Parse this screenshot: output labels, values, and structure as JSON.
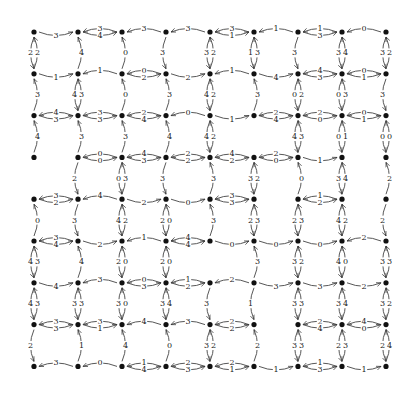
{
  "diagram": {
    "type": "grid-graph",
    "rows": 9,
    "cols": 9,
    "node_color": "#111111",
    "edge_color": "#444444",
    "horizontal_edges": [
      [
        [
          null,
          "3"
        ],
        [
          "3",
          "4"
        ],
        [
          "3",
          null
        ],
        [
          "3",
          null
        ],
        [
          "3",
          "1"
        ],
        [
          "1",
          null
        ],
        [
          "1",
          "3"
        ],
        [
          "0",
          null
        ]
      ],
      [
        [
          null,
          "1"
        ],
        [
          "1",
          null
        ],
        [
          "0",
          "2"
        ],
        [
          null,
          "2"
        ],
        [
          "1",
          null
        ],
        [
          null,
          "4"
        ],
        [
          "4",
          "3"
        ],
        [
          "0",
          "1"
        ]
      ],
      [
        [
          "4",
          "3"
        ],
        [
          "3",
          "3"
        ],
        [
          "2",
          "4"
        ],
        [
          "0",
          null
        ],
        [
          null,
          "1"
        ],
        [
          "2",
          "4"
        ],
        [
          "2",
          "0"
        ],
        [
          "0",
          "1"
        ]
      ],
      [
        [
          null,
          null
        ],
        [
          "0",
          "0"
        ],
        [
          "4",
          "3"
        ],
        [
          "2",
          "2"
        ],
        [
          "4",
          "2"
        ],
        [
          "2",
          "0"
        ],
        [
          null,
          "1"
        ],
        [
          null,
          null
        ]
      ],
      [
        [
          "3",
          "2"
        ],
        [
          "4",
          null
        ],
        [
          null,
          "2"
        ],
        [
          null,
          "0"
        ],
        [
          "3",
          "3"
        ],
        [
          null,
          null
        ],
        [
          "1",
          "2"
        ],
        [
          null,
          null
        ]
      ],
      [
        [
          "3",
          "4"
        ],
        [
          null,
          "2"
        ],
        [
          "1",
          null
        ],
        [
          "4",
          "4"
        ],
        [
          null,
          "0"
        ],
        [
          null,
          "0"
        ],
        [
          null,
          "0"
        ],
        [
          "2",
          null
        ]
      ],
      [
        [
          null,
          "4"
        ],
        [
          "3",
          null
        ],
        [
          "0",
          "3"
        ],
        [
          "1",
          "2"
        ],
        [
          "2",
          null
        ],
        [
          null,
          "3"
        ],
        [
          null,
          "3"
        ],
        [
          null,
          "2"
        ]
      ],
      [
        [
          "3",
          "3"
        ],
        [
          "3",
          "1"
        ],
        [
          "4",
          null
        ],
        [
          "3",
          null
        ],
        [
          "2",
          "2"
        ],
        [
          null,
          null
        ],
        [
          "2",
          "4"
        ],
        [
          "4",
          "0"
        ]
      ],
      [
        [
          "3",
          null
        ],
        [
          "0",
          null
        ],
        [
          "1",
          "4"
        ],
        [
          "2",
          "3"
        ],
        [
          "2",
          "1"
        ],
        [
          null,
          "1"
        ],
        [
          "1",
          "3"
        ],
        [
          null,
          "1"
        ]
      ]
    ],
    "vertical_edges": [
      [
        [
          "2",
          "2"
        ],
        [
          null,
          "3"
        ],
        [
          null,
          "4"
        ],
        [
          null,
          null
        ],
        [
          null,
          "0"
        ],
        [
          "4",
          "3"
        ],
        [
          "4",
          "3"
        ],
        [
          "2",
          null
        ]
      ],
      [
        [
          null,
          "4"
        ],
        [
          "4",
          "3"
        ],
        [
          null,
          "3"
        ],
        [
          "2",
          null
        ],
        [
          "3",
          null
        ],
        [
          null,
          "4"
        ],
        [
          "3",
          "3"
        ],
        [
          null,
          "1"
        ]
      ],
      [
        [
          null,
          "0"
        ],
        [
          null,
          "0"
        ],
        [
          null,
          "3"
        ],
        [
          "0",
          "3"
        ],
        [
          "4",
          "2"
        ],
        [
          "2",
          "0"
        ],
        [
          "3",
          "0"
        ],
        [
          null,
          "4"
        ]
      ],
      [
        [
          "3",
          null
        ],
        [
          null,
          "3"
        ],
        [
          null,
          "4"
        ],
        [
          "3",
          null
        ],
        [
          "2",
          "0"
        ],
        [
          "2",
          "0"
        ],
        [
          "3",
          "4"
        ],
        [
          null,
          "0"
        ]
      ],
      [
        [
          "3",
          "2"
        ],
        [
          "4",
          "2"
        ],
        [
          "4",
          "2"
        ],
        [
          null,
          "3"
        ],
        [
          null,
          "3"
        ],
        [
          null,
          null
        ],
        [
          "3",
          null
        ],
        [
          "3",
          "2"
        ]
      ],
      [
        [
          "1",
          "3"
        ],
        [
          null,
          "3"
        ],
        [
          null,
          null
        ],
        [
          "3",
          "2"
        ],
        [
          "2",
          "3"
        ],
        [
          null,
          "3"
        ],
        [
          "1",
          null
        ],
        [
          null,
          "2"
        ]
      ],
      [
        [
          "3",
          null
        ],
        [
          "0",
          "2"
        ],
        [
          "4",
          "3"
        ],
        [
          null,
          "0"
        ],
        [
          "2",
          "3"
        ],
        [
          "3",
          "2"
        ],
        [
          "3",
          "3"
        ],
        [
          "3",
          "3"
        ]
      ],
      [
        [
          "3",
          "4"
        ],
        [
          "0",
          "3"
        ],
        [
          "0",
          "1"
        ],
        [
          "3",
          "4"
        ],
        [
          "4",
          "2"
        ],
        [
          "4",
          "0"
        ],
        [
          "3",
          "4"
        ],
        [
          "2",
          "3"
        ]
      ],
      [
        [
          "3",
          "2"
        ],
        [
          "3",
          null
        ],
        [
          "0",
          "0"
        ],
        [
          null,
          "2"
        ],
        [
          "2",
          null
        ],
        [
          "3",
          "3"
        ],
        [
          "3",
          "2"
        ],
        [
          "2",
          "4"
        ]
      ]
    ]
  }
}
